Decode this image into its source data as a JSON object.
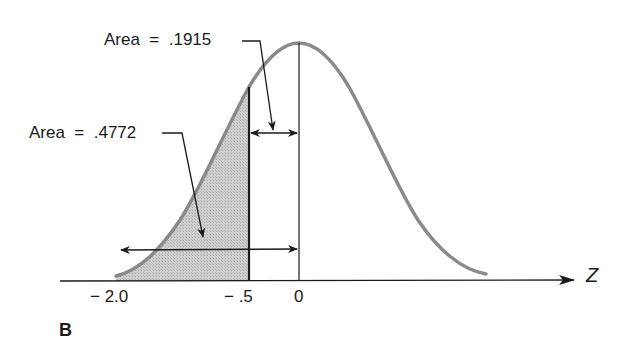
{
  "figure": {
    "panel_label": "B",
    "axis_label": "Z",
    "ticks": [
      {
        "label": "− 2.0",
        "value": -2.0
      },
      {
        "label": "− .5",
        "value": -0.5
      },
      {
        "label": "0",
        "value": 0
      }
    ],
    "annotations": [
      {
        "label": "Area  =  .1915",
        "region": "between -0.5 and 0"
      },
      {
        "label": "Area  =  .4772",
        "region": "between -2.0 and 0"
      }
    ],
    "colors": {
      "curve": "#8a8a8a",
      "shade": "#c8c8c8",
      "lines": "#1a1a1a"
    }
  }
}
